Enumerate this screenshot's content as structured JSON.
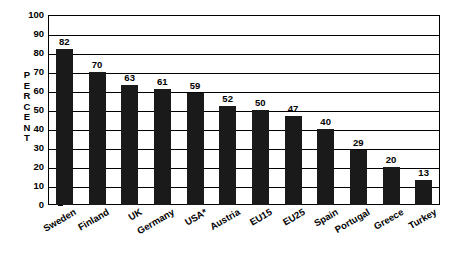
{
  "chart_data": {
    "type": "bar",
    "title": "",
    "subtitle": "",
    "xlabel": "",
    "ylabel": "PERCENT",
    "ylim": [
      0,
      100
    ],
    "yticks": [
      0,
      10,
      20,
      30,
      40,
      50,
      60,
      70,
      80,
      90,
      100
    ],
    "grid": true,
    "legend": "none",
    "orientation": "vertical",
    "bar_color": "#1a1a1a",
    "categories": [
      "Sweden",
      "Finland",
      "UK",
      "Germany",
      "USA*",
      "Austria",
      "EU15",
      "EU25",
      "Spain",
      "Portugal",
      "Greece",
      "Turkey"
    ],
    "values": [
      82,
      70,
      63,
      61,
      59,
      52,
      50,
      47,
      40,
      29,
      20,
      13
    ],
    "data_labels": [
      "82",
      "70",
      "63",
      "61",
      "59",
      "52",
      "50",
      "47",
      "40",
      "29",
      "20",
      "13"
    ],
    "annotations": []
  },
  "axis": {
    "y_title_letters": [
      "P",
      "E",
      "R",
      "C",
      "E",
      "N",
      "T"
    ]
  }
}
